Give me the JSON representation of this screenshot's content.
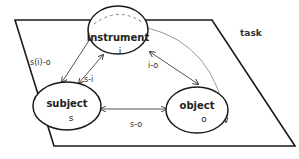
{
  "plane": {
    "label": "task"
  },
  "nodes": [
    {
      "id": "instrument",
      "name": "instrument",
      "symbol": "i"
    },
    {
      "id": "subject",
      "name": "subject",
      "symbol": "s"
    },
    {
      "id": "object",
      "name": "object",
      "symbol": "o"
    }
  ],
  "edges": [
    {
      "id": "s_i_o",
      "label": "s(i)-o",
      "from": "instrument",
      "to": "subject"
    },
    {
      "id": "s_i",
      "label": "s-i",
      "from": "subject",
      "to": "instrument"
    },
    {
      "id": "i_o",
      "label": "i-o",
      "from": "instrument",
      "to": "object"
    },
    {
      "id": "s_o",
      "label": "s-o",
      "from": "subject",
      "to": "object"
    },
    {
      "id": "curve_i_o",
      "label": "",
      "from": "instrument",
      "to": "object"
    }
  ],
  "colors": {
    "stroke": "#1a1a1a",
    "arrow": "#555555",
    "curve": "#9a9a9a"
  }
}
